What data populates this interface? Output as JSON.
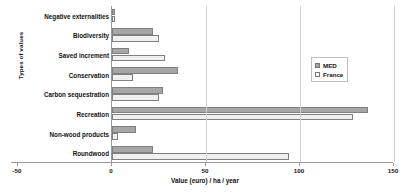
{
  "chart_data": {
    "type": "bar",
    "orientation": "horizontal",
    "title": "",
    "xlabel": "Value (euro) / ha / year",
    "ylabel": "Types of values",
    "xlim": [
      -50,
      150
    ],
    "xticks": [
      -50,
      0,
      50,
      100,
      150
    ],
    "xtick_labels": [
      "-50",
      "0",
      "50",
      "100",
      "150"
    ],
    "grid": true,
    "legend_position": "upper right",
    "categories": [
      "Negative externalities",
      "Biodiversity",
      "Saved increment",
      "Conservation",
      "Carbon sequestration",
      "Recreation",
      "Non-wood products",
      "Roundwood"
    ],
    "series": [
      {
        "name": "MED",
        "color": "#a6a6a6",
        "values": [
          1.5,
          22,
          9,
          35,
          27,
          136,
          13,
          22
        ]
      },
      {
        "name": "France",
        "color": "#f0f0f0",
        "values": [
          1.5,
          25,
          28,
          11,
          25,
          128,
          3,
          94
        ]
      }
    ]
  },
  "legend": {
    "items": [
      {
        "label": "MED",
        "swatch": "med-swatch"
      },
      {
        "label": "France",
        "swatch": "france-swatch"
      }
    ]
  }
}
